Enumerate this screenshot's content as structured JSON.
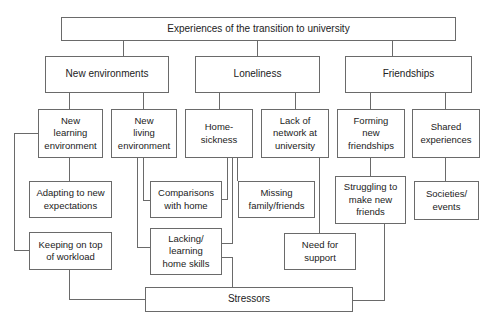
{
  "diagram": {
    "title": "Experiences of the transition to university",
    "themes": [
      {
        "label": "New environments"
      },
      {
        "label": "Loneliness"
      },
      {
        "label": "Friendships"
      }
    ],
    "subthemes": [
      {
        "label": "New\nlearning\nenvironment",
        "parent": "New environments"
      },
      {
        "label": "New\nliving\nenvironment",
        "parent": "New environments"
      },
      {
        "label": "Home-\nsickness",
        "parent": "Loneliness"
      },
      {
        "label": "Lack of\nnetwork at\nuniversity",
        "parent": "Loneliness"
      },
      {
        "label": "Forming\nnew\nfriendships",
        "parent": "Friendships"
      },
      {
        "label": "Shared\nexperiences",
        "parent": "Friendships"
      }
    ],
    "codes": [
      {
        "label": "Adapting to new\nexpectations",
        "parent": "New learning environment"
      },
      {
        "label": "Keeping on top\nof workload",
        "parent": "New learning environment"
      },
      {
        "label": "Comparisons\nwith home",
        "parent": "New living environment / Home-sickness"
      },
      {
        "label": "Lacking/\nlearning\nhome skills",
        "parent": "New living environment / Home-sickness"
      },
      {
        "label": "Missing\nfamily/friends",
        "parent": "Home-sickness"
      },
      {
        "label": "Need for\nsupport",
        "parent": "Lack of network at university"
      },
      {
        "label": "Struggling to\nmake new\nfriends",
        "parent": "Forming new friendships"
      },
      {
        "label": "Societies/\nevents",
        "parent": "Shared experiences"
      }
    ],
    "outcome": {
      "label": "Stressors"
    }
  }
}
